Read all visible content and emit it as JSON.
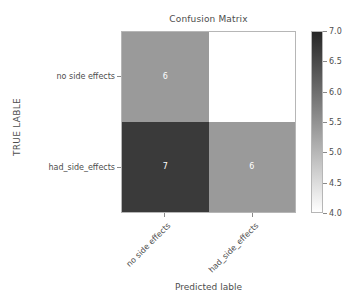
{
  "chart_data": {
    "type": "heatmap",
    "title": "Confusion Matrix",
    "xlabel": "Predicted lable",
    "ylabel": "TRUE LABLE",
    "x_categories": [
      "no side effects",
      "had_side_effects"
    ],
    "y_categories": [
      "no side effects",
      "had_side_effects"
    ],
    "matrix": [
      [
        6,
        4
      ],
      [
        7,
        6
      ]
    ],
    "cells": [
      {
        "row": 0,
        "col": 0,
        "value": "6",
        "color": "#9a9a9a",
        "text_color": "#ffffff"
      },
      {
        "row": 0,
        "col": 1,
        "value": "",
        "color": "#ffffff",
        "text_color": "#262626"
      },
      {
        "row": 1,
        "col": 0,
        "value": "7",
        "color": "#3a3a3a",
        "text_color": "#ffffff"
      },
      {
        "row": 1,
        "col": 1,
        "value": "6",
        "color": "#9a9a9a",
        "text_color": "#ffffff"
      }
    ],
    "grid": false,
    "legend_position": "right",
    "colorbar": {
      "vmin": 4.0,
      "vmax": 7.0,
      "ticks": [
        "7.0",
        "6.5",
        "6.0",
        "5.5",
        "5.0",
        "4.5",
        "4.0"
      ],
      "tick_values": [
        7.0,
        6.5,
        6.0,
        5.5,
        5.0,
        4.5,
        4.0
      ],
      "colormap": "Greys",
      "color_low": "#ffffff",
      "color_high": "#262626"
    }
  },
  "axes": {
    "x_tick_labels": [
      "no side effects",
      "had_side_effects"
    ],
    "y_tick_labels": [
      "no side effects",
      "had_side_effects"
    ]
  }
}
